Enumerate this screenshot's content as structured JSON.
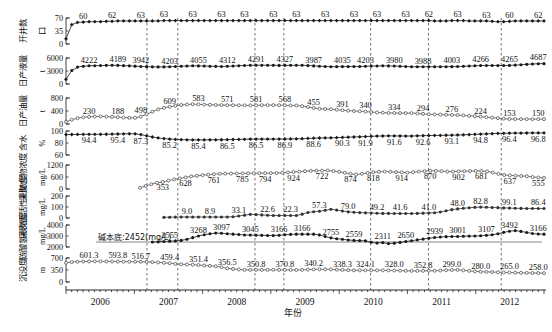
{
  "chart_data": {
    "type": "line",
    "title": "",
    "xlabel": "年份",
    "grid": false,
    "legend": "none",
    "x_axis": {
      "tick_labels": [
        "2006",
        "2007",
        "2008",
        "2009",
        "2010",
        "2011",
        "2012"
      ],
      "minor_ticks_per_year": 12,
      "range_start": "2006-01",
      "range_end": "2012-12"
    },
    "annotations": [
      {
        "text": "碱本底:2452(mg/L)",
        "panel": 6
      }
    ],
    "stage_divider_lines": [
      {
        "x_frac": 0.168
      },
      {
        "x_frac": 0.232
      },
      {
        "x_frac": 0.392
      },
      {
        "x_frac": 0.452
      },
      {
        "x_frac": 0.632
      },
      {
        "x_frac": 0.752
      },
      {
        "x_frac": 0.903
      }
    ],
    "panels": [
      {
        "ylabel_cn": "开井数",
        "ylabel_unit": "口",
        "ylim": [
          0,
          70
        ],
        "yticks": [
          0,
          35,
          70
        ],
        "marker": "filled-diamond",
        "color": "#1a1a1a",
        "data_labels": [
          "60",
          "62",
          "63",
          "63",
          "63",
          "63",
          "63",
          "63",
          "63",
          "63",
          "63",
          "63",
          "63",
          "62",
          "63",
          "63",
          "60",
          "62"
        ],
        "values": [
          14,
          52,
          58,
          59,
          60,
          60,
          60,
          61,
          61,
          62,
          62,
          62,
          62,
          62,
          62,
          62,
          62,
          63,
          63,
          63,
          63,
          63,
          63,
          63,
          63,
          63,
          63,
          63,
          63,
          63,
          63,
          63,
          63,
          63,
          63,
          63,
          63,
          63,
          63,
          63,
          63,
          63,
          63,
          63,
          63,
          63,
          63,
          63,
          63,
          63,
          63,
          63,
          63,
          63,
          63,
          63,
          63,
          63,
          63,
          63,
          63,
          63,
          63,
          63,
          62,
          62,
          62,
          63,
          63,
          63,
          62,
          62,
          62,
          62,
          61,
          60,
          60,
          61,
          62,
          62,
          62,
          62,
          62,
          62
        ]
      },
      {
        "ylabel_cn": "日产液量",
        "ylabel_unit": "t",
        "ylim": [
          0,
          6000
        ],
        "yticks": [
          0,
          3000,
          6000
        ],
        "marker": "filled-circle",
        "color": "#1a1a1a",
        "data_labels": [
          "4222",
          "4189",
          "3942",
          "4203",
          "4055",
          "4312",
          "4291",
          "4327",
          "3987",
          "4035",
          "4203",
          "3980",
          "3988",
          "4003",
          "4266",
          "4265",
          "4687"
        ],
        "values": [
          1100,
          3100,
          3900,
          4100,
          4200,
          4222,
          4260,
          4300,
          4320,
          4300,
          4230,
          4189,
          4120,
          4050,
          4000,
          3960,
          3942,
          3950,
          3980,
          4030,
          4090,
          4150,
          4203,
          4180,
          4140,
          4100,
          4070,
          4055,
          4090,
          4150,
          4220,
          4280,
          4312,
          4330,
          4340,
          4330,
          4310,
          4291,
          4300,
          4320,
          4327,
          4310,
          4250,
          4180,
          4110,
          4050,
          3987,
          4000,
          4010,
          4020,
          4035,
          4050,
          4090,
          4130,
          4170,
          4203,
          4180,
          4140,
          4090,
          4040,
          3995,
          3980,
          3982,
          3985,
          3988,
          3992,
          3998,
          4003,
          4030,
          4080,
          4140,
          4200,
          4266,
          4270,
          4268,
          4266,
          4265,
          4290,
          4360,
          4450,
          4540,
          4620,
          4687,
          4700
        ]
      },
      {
        "ylabel_cn": "日产油量",
        "ylabel_unit": "t",
        "ylim": [
          0,
          800
        ],
        "yticks": [
          0,
          400,
          800
        ],
        "marker": "open-circle",
        "color": "#555555",
        "data_labels": [
          "230",
          "188",
          "498",
          "609",
          "583",
          "571",
          "581",
          "568",
          "455",
          "391",
          "340",
          "334",
          "294",
          "276",
          "224",
          "153",
          "150"
        ],
        "values": [
          65,
          130,
          180,
          205,
          220,
          230,
          232,
          228,
          220,
          210,
          198,
          188,
          190,
          230,
          300,
          380,
          450,
          498,
          530,
          560,
          585,
          600,
          609,
          605,
          598,
          590,
          585,
          583,
          580,
          578,
          575,
          573,
          571,
          574,
          578,
          580,
          581,
          578,
          574,
          570,
          568,
          550,
          520,
          495,
          470,
          460,
          455,
          440,
          425,
          410,
          400,
          391,
          380,
          368,
          355,
          348,
          340,
          338,
          336,
          335,
          334,
          325,
          312,
          300,
          294,
          290,
          285,
          280,
          276,
          265,
          250,
          238,
          224,
          210,
          195,
          180,
          165,
          153,
          152,
          151,
          150,
          150,
          150,
          149
        ]
      },
      {
        "ylabel_cn": "含水",
        "ylabel_unit": "%",
        "ylim": [
          60,
          100
        ],
        "yticks": [
          60,
          80,
          100
        ],
        "marker": "filled-diamond",
        "color": "#1a1a1a",
        "data_labels": [
          "94.4",
          "95.4",
          "87.3",
          "85.2",
          "85.4",
          "86.5",
          "86.5",
          "86.9",
          "88.6",
          "90.3",
          "91.9",
          "91.6",
          "92.6",
          "93.1",
          "94.8",
          "96.4",
          "96.8"
        ],
        "values": [
          94.0,
          94.2,
          94.3,
          94.4,
          94.5,
          94.4,
          94.5,
          94.6,
          94.8,
          95.0,
          95.2,
          95.4,
          95.3,
          94.0,
          92.0,
          90.0,
          88.5,
          87.3,
          86.6,
          86.0,
          85.6,
          85.3,
          85.2,
          85.2,
          85.2,
          85.3,
          85.3,
          85.4,
          85.6,
          85.8,
          86.0,
          86.2,
          86.5,
          86.5,
          86.5,
          86.5,
          86.5,
          86.6,
          86.7,
          86.8,
          86.9,
          87.2,
          87.6,
          88.0,
          88.3,
          88.5,
          88.6,
          88.9,
          89.3,
          89.7,
          90.0,
          90.3,
          90.7,
          91.1,
          91.5,
          91.7,
          91.9,
          91.8,
          91.7,
          91.6,
          91.6,
          91.9,
          92.2,
          92.4,
          92.6,
          92.7,
          92.9,
          93.1,
          93.3,
          93.6,
          94.0,
          94.4,
          94.8,
          95.2,
          95.6,
          96.0,
          96.2,
          96.4,
          96.5,
          96.6,
          96.7,
          96.8,
          96.8,
          96.8
        ]
      },
      {
        "ylabel_cn": "采聚合物浓度",
        "ylabel_unit": "mg/L",
        "ylim": [
          0,
          1200
        ],
        "yticks": [
          0,
          600,
          1200
        ],
        "marker": "open-circle",
        "color": "#555555",
        "data_labels": [
          "353",
          "628",
          "761",
          "785",
          "794",
          "924",
          "722",
          "874",
          "818",
          "914",
          "870",
          "902",
          "681",
          "637",
          "555"
        ],
        "values": [
          null,
          null,
          null,
          null,
          null,
          null,
          null,
          null,
          null,
          null,
          null,
          null,
          null,
          60,
          150,
          240,
          310,
          353,
          420,
          480,
          530,
          580,
          628,
          660,
          690,
          715,
          740,
          761,
          768,
          773,
          778,
          782,
          785,
          788,
          790,
          792,
          794,
          800,
          812,
          828,
          848,
          870,
          890,
          905,
          915,
          920,
          924,
          900,
          860,
          810,
          760,
          722,
          760,
          800,
          840,
          860,
          874,
          860,
          845,
          830,
          818,
          840,
          870,
          895,
          914,
          905,
          890,
          870,
          870,
          880,
          890,
          898,
          902,
          905,
          880,
          820,
          760,
          700,
          681,
          665,
          650,
          637,
          600,
          575,
          555
        ]
      },
      {
        "ylabel_cn": "采表面活性剂浓度",
        "ylabel_unit": "mg/L",
        "ylim": [
          0,
          200
        ],
        "yticks": [
          0,
          100,
          200
        ],
        "marker": "filled-circle",
        "color": "#333333",
        "data_labels": [
          "9.0",
          "8.9",
          "33.1",
          "22.6",
          "22.3",
          "57.3",
          "79.0",
          "49.2",
          "41.6",
          "41.0",
          "48.0",
          "82.8",
          "99.1",
          "86.4"
        ],
        "values": [
          null,
          null,
          null,
          null,
          null,
          null,
          null,
          null,
          null,
          null,
          null,
          null,
          null,
          null,
          null,
          null,
          null,
          6.0,
          7.5,
          8.4,
          8.8,
          9.0,
          8.9,
          8.9,
          8.9,
          8.9,
          8.9,
          8.9,
          9.5,
          12.0,
          18.0,
          26.0,
          33.1,
          31.0,
          28.0,
          25.0,
          22.6,
          22.4,
          22.3,
          22.3,
          22.3,
          35.0,
          50.0,
          57.3,
          62.0,
          70.0,
          79.0,
          72.0,
          64.0,
          56.0,
          52.0,
          49.2,
          47.0,
          45.0,
          43.0,
          42.0,
          41.6,
          41.4,
          41.2,
          41.1,
          41.0,
          42.0,
          44.0,
          46.0,
          48.0,
          55.0,
          66.0,
          76.0,
          82.8,
          88.0,
          93.0,
          97.0,
          99.1,
          98.0,
          96.0,
          94.0,
          92.0,
          90.0,
          88.5,
          87.5,
          86.9,
          86.4,
          86.4,
          86.4
        ]
      },
      {
        "ylabel_cn": "碳酸氢根浓度",
        "ylabel_unit": "mg/L",
        "ylim": [
          2000,
          4000
        ],
        "yticks": [
          2000,
          3000,
          4000
        ],
        "marker": "filled-circle",
        "color": "#1a1a1a",
        "baseline_value": 2452,
        "baseline_label": "碱本底:2452(mg/L)",
        "data_labels": [
          "2555",
          "3268",
          "3097",
          "3045",
          "3166",
          "3166",
          "2755",
          "2559",
          "2311",
          "2650",
          "2939",
          "3001",
          "3107",
          "3492",
          "3166"
        ],
        "values": [
          null,
          null,
          null,
          null,
          null,
          null,
          null,
          null,
          null,
          null,
          null,
          null,
          null,
          null,
          null,
          2452,
          2470,
          2500,
          2530,
          2555,
          2600,
          2700,
          2850,
          3000,
          3120,
          3200,
          3268,
          3250,
          3210,
          3170,
          3130,
          3097,
          3085,
          3070,
          3058,
          3050,
          3045,
          3070,
          3110,
          3145,
          3166,
          3170,
          3168,
          3166,
          3100,
          2950,
          2830,
          2755,
          2700,
          2640,
          2600,
          2580,
          2559,
          2430,
          2360,
          2400,
          2311,
          2350,
          2420,
          2500,
          2570,
          2650,
          2720,
          2790,
          2860,
          2910,
          2939,
          2950,
          2960,
          2975,
          2990,
          3001,
          3020,
          3060,
          3107,
          3200,
          3330,
          3430,
          3492,
          3420,
          3320,
          3230,
          3180,
          3166
        ]
      },
      {
        "ylabel_cn": "沉没度",
        "ylabel_unit": "m",
        "ylim": [
          0,
          700
        ],
        "yticks": [
          0,
          350,
          700
        ],
        "marker": "open-circle",
        "color": "#555555",
        "data_labels": [
          "601.3",
          "593.8",
          "516.7",
          "459.4",
          "351.4",
          "356.5",
          "350.8",
          "370.8",
          "340.2",
          "338.3",
          "324.1",
          "328.0",
          "352.8",
          "299.0",
          "280.0",
          "265.0",
          "258.0"
        ],
        "values": [
          560,
          580,
          592,
          598,
          601.3,
          603,
          602,
          600,
          598,
          596,
          595,
          593.8,
          592,
          590,
          586,
          580,
          570,
          560,
          545,
          530,
          516.7,
          512,
          505,
          495,
          480,
          470,
          459.4,
          430,
          400,
          380,
          365,
          355,
          351.4,
          352,
          353,
          354,
          356.5,
          355,
          353,
          352,
          350.8,
          355,
          362,
          368,
          370,
          370.8,
          368,
          360,
          352,
          346,
          342,
          340.2,
          340,
          339.5,
          339,
          338.5,
          338.3,
          336,
          332,
          328,
          324.1,
          325,
          326,
          327,
          328.0,
          335,
          343,
          350,
          352.8,
          340,
          325,
          310,
          299.0,
          295,
          290,
          285,
          280.0,
          276,
          272,
          268,
          265.0,
          262,
          260,
          258.0
        ]
      }
    ]
  }
}
